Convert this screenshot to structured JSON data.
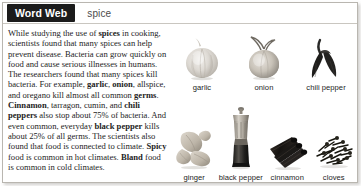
{
  "header": {
    "tab_label": "Word Web",
    "headword": "spice"
  },
  "article": {
    "segments": [
      {
        "text": "While studying the use of ",
        "bold": false
      },
      {
        "text": "spices",
        "bold": true
      },
      {
        "text": " in cooking, scientists found that many spices can help prevent disease. Bacteria can grow quickly on food and cause serious illnesses in humans. The researchers found that many spices kill bacteria. For example, ",
        "bold": false
      },
      {
        "text": "garlic",
        "bold": true
      },
      {
        "text": ", ",
        "bold": false
      },
      {
        "text": "onion",
        "bold": true
      },
      {
        "text": ", allspice, and oregano kill almost all common ",
        "bold": false
      },
      {
        "text": "germs",
        "bold": true
      },
      {
        "text": ". ",
        "bold": false
      },
      {
        "text": "Cinnamon",
        "bold": true
      },
      {
        "text": ", tarragon, cumin, and ",
        "bold": false
      },
      {
        "text": "chili peppers",
        "bold": true
      },
      {
        "text": " also stop about 75% of bacteria. And even common, everyday ",
        "bold": false
      },
      {
        "text": "black pepper",
        "bold": true
      },
      {
        "text": " kills about 25% of all germs. The scientists also found that food is connected to climate. ",
        "bold": false
      },
      {
        "text": "Spicy",
        "bold": true
      },
      {
        "text": " food is common in hot climates. ",
        "bold": false
      },
      {
        "text": "Bland",
        "bold": true
      },
      {
        "text": " food is common in cold climates.",
        "bold": false
      }
    ]
  },
  "gallery": {
    "top_row": [
      {
        "label": "garlic",
        "icon": "garlic-bulb-photo"
      },
      {
        "label": "onion",
        "icon": "onion-photo"
      },
      {
        "label": "chili pepper",
        "icon": "chili-pepper-photo"
      }
    ],
    "bottom_row": [
      {
        "label": "ginger",
        "icon": "ginger-root-photo"
      },
      {
        "label": "black pepper",
        "icon": "pepper-grinder-photo"
      },
      {
        "label": "cinnamon",
        "icon": "cinnamon-sticks-photo"
      },
      {
        "label": "cloves",
        "icon": "cloves-pile-photo"
      }
    ]
  },
  "colors": {
    "tab_background": "#1b1b1b",
    "tab_text": "#ffffff",
    "headword_text": "#4c4c4c",
    "body_text": "#1d1d1d",
    "border": "#b9b6b0",
    "page_background": "#ffffff"
  }
}
